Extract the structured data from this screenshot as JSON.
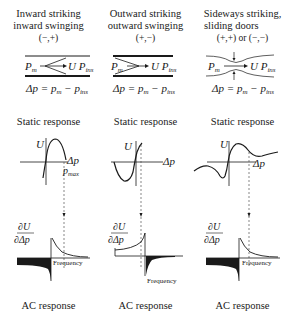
{
  "columns": [
    {
      "title_line1": "Inward striking",
      "title_line2": "inward swinging",
      "sign": "(−,+)",
      "channel": {
        "left": "P",
        "left_sub": "m",
        "right": "U P",
        "right_sub": "ins"
      },
      "equation": "Δp = pₘ − pᵢₙₛ",
      "eq_parts": {
        "lhs": "Δp = p",
        "sub1": "m",
        "mid": " − p",
        "sub2": "ins"
      },
      "static_label": "Static response",
      "static_axis": {
        "y": "U",
        "x": "Δp",
        "marker": "p",
        "marker_sub": "max"
      },
      "ac_axis": {
        "y_num": "∂U",
        "y_den": "∂Δp",
        "x": "Frequency"
      },
      "ac_label": "AC response"
    },
    {
      "title_line1": "Outward striking",
      "title_line2": "outward swinging",
      "sign": "(+,−)",
      "channel": {
        "left": "P",
        "left_sub": "m",
        "right": "U P",
        "right_sub": "ins"
      },
      "eq_parts": {
        "lhs": "Δp = p",
        "sub1": "m",
        "mid": " − p",
        "sub2": "ins"
      },
      "static_label": "Static response",
      "static_axis": {
        "y": "U",
        "x": "Δp"
      },
      "ac_axis": {
        "y_num": "∂U",
        "y_den": "∂Δp",
        "x": "Frequency"
      },
      "ac_label": "AC response"
    },
    {
      "title_line1": "Sideways striking,",
      "title_line2": "sliding doors",
      "sign": "(+,+) or (−,−)",
      "channel": {
        "left": "P",
        "left_sub": "m",
        "right": "U P",
        "right_sub": "ins"
      },
      "eq_parts": {
        "lhs": "Δp = p",
        "sub1": "m",
        "mid": " − p",
        "sub2": "ins"
      },
      "static_label": "Static response",
      "static_axis": {
        "y": "U",
        "x": "Δp"
      },
      "ac_axis": {
        "y_num": "∂U",
        "y_den": "∂Δp",
        "x": "Frequency"
      },
      "ac_label": "AC response"
    }
  ],
  "colors": {
    "ink": "#1a1a1a",
    "fill": "#1a1a1a",
    "dashed": "#555555"
  }
}
